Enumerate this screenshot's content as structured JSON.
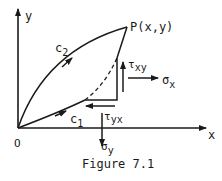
{
  "figure": {
    "caption": "Figure 7.1",
    "axes": {
      "x_label": "x",
      "y_label": "y",
      "origin_label": "O"
    },
    "point": {
      "label": "P(x,y)"
    },
    "paths": [
      {
        "name": "c2",
        "label_main": "c",
        "label_sub": "2",
        "style": "solid",
        "shape": "upper curve from O to P"
      },
      {
        "name": "c1",
        "label_main": "c",
        "label_sub": "1",
        "style": "solid-then-dashed",
        "shape": "lower curve from O to P"
      }
    ],
    "stresses": {
      "tau_xy": {
        "symbol": "τ",
        "sub": "xy",
        "direction": "up"
      },
      "sigma_x": {
        "symbol": "σ",
        "sub": "x",
        "direction": "right"
      },
      "tau_yx": {
        "symbol": "τ",
        "sub": "yx",
        "direction": "left"
      },
      "sigma_y": {
        "symbol": "σ",
        "sub": "y",
        "direction": "down"
      }
    },
    "colors": {
      "ink": "#1a1a1a",
      "background": "#ffffff"
    }
  }
}
